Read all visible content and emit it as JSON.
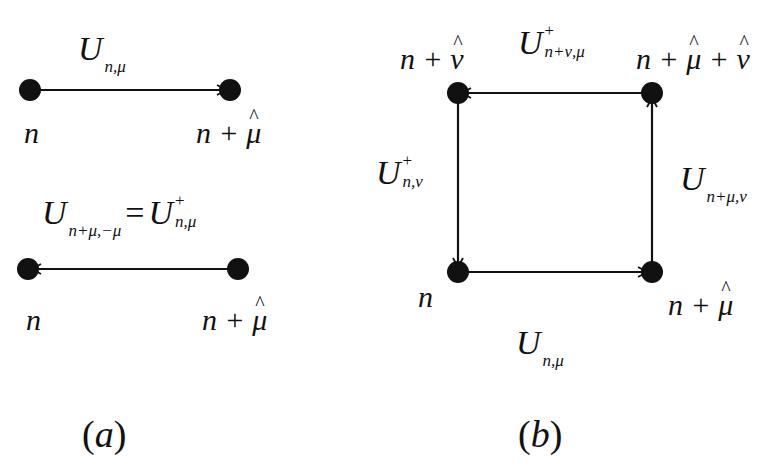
{
  "panel_a": {
    "top_link": {
      "label_base": "U",
      "label_sub": "n,μ",
      "from": "n",
      "to": "n + μ̂",
      "direction": "right"
    },
    "bottom_link": {
      "label_lhs_base": "U",
      "label_lhs_sub": "n+μ,−μ",
      "equals": "=",
      "label_rhs_base": "U",
      "label_rhs_sup": "+",
      "label_rhs_sub": "n,μ",
      "from": "n + μ̂",
      "to": "n",
      "direction": "left"
    },
    "node_left_top": "n",
    "node_right_top_base": "n + ",
    "node_right_top_hat": "μ",
    "node_left_bottom": "n",
    "node_right_bottom_base": "n + ",
    "node_right_bottom_hat": "μ",
    "caption_open": "(",
    "caption_letter": "a",
    "caption_close": ")"
  },
  "panel_b": {
    "node_top_left_base": "n + ",
    "node_top_left_hat": "ν",
    "node_top_right_base": "n + ",
    "node_top_right_hat1": "μ",
    "node_top_right_mid": " + ",
    "node_top_right_hat2": "ν",
    "node_bottom_left": "n",
    "node_bottom_right_base": "n + ",
    "node_bottom_right_hat": "μ",
    "link_top": {
      "base": "U",
      "sup": "+",
      "sub": "n+ν,μ",
      "direction": "left"
    },
    "link_left": {
      "base": "U",
      "sup": "+",
      "sub": "n,ν",
      "direction": "down"
    },
    "link_right": {
      "base": "U",
      "sub": "n+μ,ν",
      "direction": "up"
    },
    "link_bottom": {
      "base": "U",
      "sub": "n,μ",
      "direction": "right"
    },
    "caption_open": "(",
    "caption_letter": "b",
    "caption_close": ")"
  }
}
